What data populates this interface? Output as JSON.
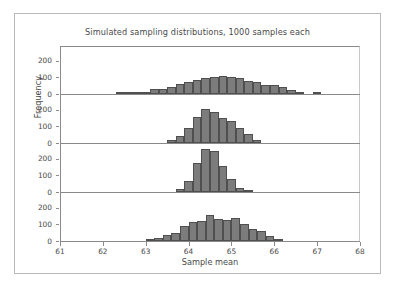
{
  "figure": {
    "title": "Simulated sampling distributions, 1000 samples each",
    "xlabel": "Sample mean",
    "ylabel": "Frequency",
    "bar_color": "#7c7c7c",
    "bar_edge_color": "#4f4f4f",
    "axis_color": "#8a8a8a",
    "background": "#ffffff"
  },
  "axes": {
    "x_ticks": [
      61,
      62,
      63,
      64,
      65,
      66,
      67,
      68
    ],
    "x_range": [
      61,
      68
    ],
    "y_ticks": [
      0,
      100,
      200
    ],
    "y_range": [
      0,
      290
    ]
  },
  "chart_data": {
    "type": "bar",
    "title": "Simulated sampling distributions, 1000 samples each",
    "xlabel": "Sample mean",
    "ylabel": "Frequency",
    "xlim": [
      61,
      68
    ],
    "ylim": [
      0,
      290
    ],
    "grid": false,
    "legend": "none",
    "bin_width": 0.2,
    "panels": [
      {
        "name": "panel-1",
        "yticks": [
          0,
          100,
          200
        ],
        "bins": [
          62.3,
          62.5,
          62.7,
          62.9,
          63.1,
          63.3,
          63.5,
          63.7,
          63.9,
          64.1,
          64.3,
          64.5,
          64.7,
          64.9,
          65.1,
          65.3,
          65.5,
          65.7,
          65.9,
          66.1,
          66.3,
          66.5,
          66.9
        ],
        "values": [
          7,
          8,
          10,
          12,
          28,
          30,
          45,
          60,
          70,
          86,
          95,
          105,
          108,
          102,
          98,
          80,
          70,
          55,
          52,
          42,
          22,
          12,
          8
        ]
      },
      {
        "name": "panel-2",
        "yticks": [
          0,
          100,
          200
        ],
        "bins": [
          63.5,
          63.7,
          63.9,
          64.1,
          64.3,
          64.5,
          64.7,
          64.9,
          65.1,
          65.3,
          65.5
        ],
        "values": [
          20,
          45,
          90,
          160,
          205,
          185,
          150,
          130,
          92,
          52,
          20
        ]
      },
      {
        "name": "panel-3",
        "yticks": [
          0,
          100,
          200
        ],
        "bins": [
          63.7,
          63.9,
          64.1,
          64.3,
          64.5,
          64.7,
          64.9,
          65.1,
          65.3
        ],
        "values": [
          18,
          65,
          175,
          262,
          250,
          160,
          78,
          25,
          10
        ]
      },
      {
        "name": "panel-4",
        "yticks": [
          0,
          100,
          200
        ],
        "bins": [
          63.0,
          63.2,
          63.4,
          63.6,
          63.8,
          64.0,
          64.2,
          64.4,
          64.6,
          64.8,
          65.0,
          65.2,
          65.4,
          65.6,
          65.8,
          66.0
        ],
        "values": [
          12,
          18,
          35,
          48,
          88,
          112,
          118,
          155,
          130,
          128,
          138,
          105,
          72,
          60,
          32,
          10
        ]
      }
    ]
  }
}
